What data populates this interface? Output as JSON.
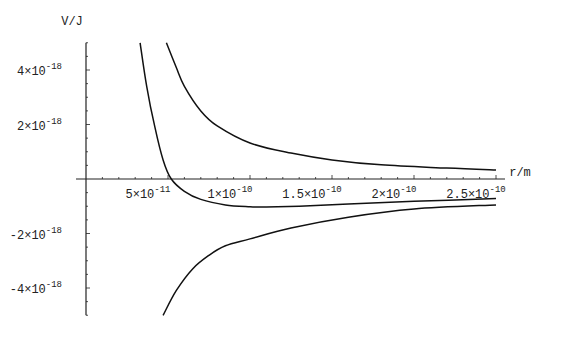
{
  "chart_data": {
    "type": "line",
    "title": "",
    "xlabel": "r/m",
    "ylabel": "V/J",
    "xlim": [
      0,
      2.5e-10
    ],
    "ylim": [
      -5e-18,
      5e-18
    ],
    "grid": false,
    "legend": null,
    "x_ticks": [
      {
        "value": 5e-11,
        "mant": "5×10",
        "exp": "-11"
      },
      {
        "value": 1e-10,
        "mant": "1×10",
        "exp": "-10"
      },
      {
        "value": 1.5e-10,
        "mant": "1.5×10",
        "exp": "-10"
      },
      {
        "value": 2e-10,
        "mant": "2×10",
        "exp": "-10"
      },
      {
        "value": 2.5e-10,
        "mant": "2.5×10",
        "exp": "-10"
      }
    ],
    "y_ticks": [
      {
        "value": 4e-18,
        "mant": "4×10",
        "exp": "-18"
      },
      {
        "value": 2e-18,
        "mant": "2×10",
        "exp": "-18"
      },
      {
        "value": -2e-18,
        "mant": "-2×10",
        "exp": "-18"
      },
      {
        "value": -4e-18,
        "mant": "-4×10",
        "exp": "-18"
      }
    ],
    "series": [
      {
        "name": "repulsive",
        "x": [
          4.9e-11,
          5.5e-11,
          6e-11,
          7e-11,
          8e-11,
          1e-10,
          1.25e-10,
          1.5e-10,
          1.8e-10,
          2.2e-10,
          2.5e-10
        ],
        "y": [
          5e-18,
          4.1e-18,
          3.4e-18,
          2.5e-18,
          1.95e-18,
          1.32e-18,
          9.5e-19,
          7e-19,
          5.2e-19,
          4e-19,
          3.3e-19
        ]
      },
      {
        "name": "total",
        "x": [
          3.3e-11,
          3.7e-11,
          4.2e-11,
          4.7e-11,
          5.2e-11,
          6e-11,
          7e-11,
          8.5e-11,
          1e-10,
          1.1e-10,
          1.3e-10,
          1.6e-10,
          2e-10,
          2.5e-10
        ],
        "y": [
          5e-18,
          3.4e-18,
          1.9e-18,
          7e-19,
          0.0,
          -4.5e-19,
          -7.5e-19,
          -9.5e-19,
          -1.02e-18,
          -1.03e-18,
          -1e-18,
          -9.2e-19,
          -8.2e-19,
          -7.2e-19
        ]
      },
      {
        "name": "attractive",
        "x": [
          4.7e-11,
          5.5e-11,
          6.5e-11,
          7.5e-11,
          8.5e-11,
          1e-10,
          1.25e-10,
          1.6e-10,
          2e-10,
          2.5e-10
        ],
        "y": [
          -5e-18,
          -4.1e-18,
          -3.3e-18,
          -2.8e-18,
          -2.45e-18,
          -2.2e-18,
          -1.8e-18,
          -1.4e-18,
          -1.1e-18,
          -9.5e-19
        ]
      }
    ]
  }
}
